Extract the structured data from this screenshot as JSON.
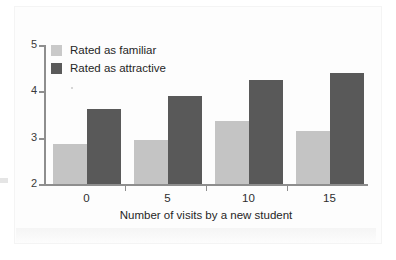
{
  "figure": {
    "background_color": "#ffffff",
    "axis_color": "#8e8e8e",
    "text_color": "#262626"
  },
  "chart_data": {
    "type": "bar",
    "title": "",
    "subtitle": "",
    "xlabel": "Number of visits by a new student",
    "ylabel": "",
    "categories": [
      "0",
      "5",
      "10",
      "15"
    ],
    "series": [
      {
        "name": "Rated as familiar",
        "color": "#c4c4c4",
        "values": [
          2.87,
          2.95,
          3.37,
          3.15
        ]
      },
      {
        "name": "Rated as attractive",
        "color": "#595959",
        "values": [
          3.62,
          3.89,
          4.24,
          4.39
        ]
      }
    ],
    "ylim": [
      2,
      5
    ],
    "yticks": [
      "2",
      "3",
      "4",
      "5"
    ],
    "xticks": [
      "0",
      "5",
      "10",
      "15"
    ],
    "grid": false,
    "legend_position": "top-left"
  },
  "legend": {
    "items": [
      {
        "label": "Rated as familiar",
        "swatch": "#c9c9c9"
      },
      {
        "label": "Rated as attractive",
        "swatch": "#5a5a5a"
      }
    ]
  },
  "axes": {
    "y_tick_labels": [
      "5",
      "4",
      "3",
      "2"
    ],
    "x_tick_labels": [
      "0",
      "5",
      "10",
      "15"
    ],
    "x_title": "Number of visits by a new student"
  }
}
